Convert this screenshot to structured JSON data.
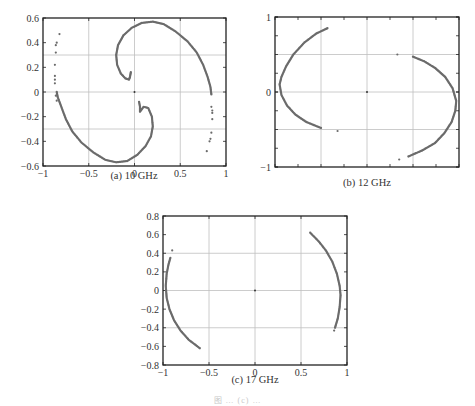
{
  "figure": {
    "caption": "图 … (c) …"
  },
  "chart_data": [
    {
      "id": "a",
      "type": "scatter",
      "title": "(a) 10 GHz",
      "xlabel": "",
      "ylabel": "",
      "xlim": [
        -1,
        1
      ],
      "ylim": [
        -0.6,
        0.6
      ],
      "xticks": [
        -1,
        -0.5,
        0,
        0.5,
        1
      ],
      "xtick_labels": [
        "−1",
        "−0.5",
        "0",
        "0.5",
        "1"
      ],
      "yticks": [
        -0.6,
        -0.4,
        -0.2,
        0,
        0.2,
        0.4,
        0.6
      ],
      "ytick_labels": [
        "−0.6",
        "−0.4",
        "−0.2",
        "0",
        "0.2",
        "0.4",
        "0.6"
      ],
      "minor_xticks": [],
      "minor_yticks": [],
      "grid_x": [
        -0.5,
        0,
        0.5
      ],
      "grid_y": [
        -0.3,
        0,
        0.3
      ],
      "center_point": [
        0,
        0
      ],
      "series": [
        {
          "name": "upper-spiral-arm",
          "points": [
            [
              -0.04,
              0.16
            ],
            [
              -0.05,
              0.12
            ],
            [
              -0.06,
              0.1
            ],
            [
              -0.1,
              0.11
            ],
            [
              -0.15,
              0.15
            ],
            [
              -0.19,
              0.22
            ],
            [
              -0.2,
              0.3
            ],
            [
              -0.18,
              0.38
            ],
            [
              -0.12,
              0.46
            ],
            [
              -0.03,
              0.52
            ],
            [
              0.08,
              0.56
            ],
            [
              0.2,
              0.57
            ],
            [
              0.32,
              0.55
            ],
            [
              0.45,
              0.49
            ],
            [
              0.58,
              0.41
            ],
            [
              0.68,
              0.32
            ],
            [
              0.75,
              0.22
            ],
            [
              0.8,
              0.12
            ],
            [
              0.83,
              0.04
            ],
            [
              0.84,
              -0.02
            ]
          ]
        },
        {
          "name": "lower-spiral-arm",
          "points": [
            [
              0.05,
              -0.08
            ],
            [
              0.06,
              -0.12
            ],
            [
              0.06,
              -0.16
            ],
            [
              0.1,
              -0.12
            ],
            [
              0.15,
              -0.13
            ],
            [
              0.19,
              -0.2
            ],
            [
              0.2,
              -0.28
            ],
            [
              0.18,
              -0.36
            ],
            [
              0.12,
              -0.44
            ],
            [
              0.03,
              -0.51
            ],
            [
              -0.08,
              -0.56
            ],
            [
              -0.2,
              -0.57
            ],
            [
              -0.32,
              -0.55
            ],
            [
              -0.45,
              -0.49
            ],
            [
              -0.58,
              -0.41
            ],
            [
              -0.68,
              -0.32
            ],
            [
              -0.75,
              -0.22
            ],
            [
              -0.8,
              -0.12
            ],
            [
              -0.84,
              -0.04
            ],
            [
              -0.85,
              0.0
            ]
          ]
        },
        {
          "name": "left-scatter",
          "points": [
            [
              -0.82,
              0.47
            ],
            [
              -0.85,
              0.4
            ],
            [
              -0.86,
              0.38
            ],
            [
              -0.86,
              0.32
            ],
            [
              -0.87,
              0.22
            ],
            [
              -0.87,
              0.13
            ],
            [
              -0.87,
              0.1
            ],
            [
              -0.87,
              0.07
            ],
            [
              -0.86,
              -0.03
            ],
            [
              -0.85,
              -0.07
            ]
          ]
        },
        {
          "name": "right-scatter",
          "points": [
            [
              0.84,
              -0.12
            ],
            [
              0.85,
              -0.15
            ],
            [
              0.85,
              -0.17
            ],
            [
              0.85,
              -0.22
            ],
            [
              0.84,
              -0.33
            ],
            [
              0.83,
              -0.38
            ],
            [
              0.82,
              -0.4
            ],
            [
              0.79,
              -0.48
            ]
          ]
        }
      ]
    },
    {
      "id": "b",
      "type": "scatter",
      "title": "(b) 12 GHz",
      "xlabel": "",
      "ylabel": "",
      "xlim": [
        -1,
        1
      ],
      "ylim": [
        -1,
        1
      ],
      "xticks": [],
      "xtick_labels": [],
      "yticks": [
        -1,
        0,
        1
      ],
      "ytick_labels": [
        "−1",
        "0",
        "1"
      ],
      "minor_xticks": [
        -1,
        -0.75,
        -0.5,
        -0.25,
        0,
        0.25,
        0.5,
        0.75,
        1
      ],
      "minor_yticks": [
        -1,
        -0.75,
        -0.5,
        -0.25,
        0,
        0.25,
        0.5,
        0.75,
        1
      ],
      "grid_x": [
        -0.5,
        0,
        0.5
      ],
      "grid_y": [
        -0.5,
        0,
        0.5
      ],
      "center_point": [
        0,
        0
      ],
      "series": [
        {
          "name": "left-arc",
          "points": [
            [
              -0.43,
              0.85
            ],
            [
              -0.55,
              0.78
            ],
            [
              -0.68,
              0.66
            ],
            [
              -0.8,
              0.5
            ],
            [
              -0.88,
              0.34
            ],
            [
              -0.93,
              0.2
            ],
            [
              -0.95,
              0.1
            ],
            [
              -0.93,
              -0.04
            ],
            [
              -0.87,
              -0.18
            ],
            [
              -0.78,
              -0.3
            ],
            [
              -0.66,
              -0.4
            ],
            [
              -0.5,
              -0.48
            ]
          ]
        },
        {
          "name": "right-arc",
          "points": [
            [
              0.5,
              0.47
            ],
            [
              0.62,
              0.41
            ],
            [
              0.74,
              0.32
            ],
            [
              0.85,
              0.2
            ],
            [
              0.93,
              0.05
            ],
            [
              0.97,
              -0.12
            ],
            [
              0.96,
              -0.25
            ],
            [
              0.92,
              -0.4
            ],
            [
              0.84,
              -0.55
            ],
            [
              0.74,
              -0.68
            ],
            [
              0.6,
              -0.78
            ],
            [
              0.45,
              -0.86
            ]
          ]
        },
        {
          "name": "isolated-points",
          "points": [
            [
              0.33,
              0.5
            ],
            [
              -0.32,
              -0.52
            ],
            [
              0.35,
              -0.9
            ]
          ]
        }
      ]
    },
    {
      "id": "c",
      "type": "scatter",
      "title": "(c) 17 GHz",
      "xlabel": "",
      "ylabel": "",
      "xlim": [
        -1,
        1
      ],
      "ylim": [
        -0.8,
        0.8
      ],
      "xticks": [
        -1,
        -0.5,
        0,
        0.5,
        1
      ],
      "xtick_labels": [
        "−1",
        "−0.5",
        "0",
        "0.5",
        "1"
      ],
      "yticks": [
        -0.8,
        -0.6,
        -0.4,
        -0.2,
        0,
        0.2,
        0.4,
        0.6,
        0.8
      ],
      "ytick_labels": [
        "−0.8",
        "−0.6",
        "−0.4",
        "−0.2",
        "0",
        "0.2",
        "0.4",
        "0.6",
        "0.8"
      ],
      "minor_xticks": [],
      "minor_yticks": [],
      "grid_x": [
        -0.5,
        0,
        0.5
      ],
      "grid_y": [
        -0.4,
        0,
        0.4
      ],
      "center_point": [
        0,
        0
      ],
      "series": [
        {
          "name": "left-arc",
          "points": [
            [
              -0.92,
              0.35
            ],
            [
              -0.94,
              0.28
            ],
            [
              -0.96,
              0.18
            ],
            [
              -0.97,
              0.05
            ],
            [
              -0.96,
              -0.08
            ],
            [
              -0.93,
              -0.2
            ],
            [
              -0.88,
              -0.32
            ],
            [
              -0.81,
              -0.43
            ],
            [
              -0.72,
              -0.53
            ],
            [
              -0.6,
              -0.62
            ]
          ]
        },
        {
          "name": "right-arc",
          "points": [
            [
              0.6,
              0.62
            ],
            [
              0.69,
              0.53
            ],
            [
              0.77,
              0.43
            ],
            [
              0.84,
              0.31
            ],
            [
              0.89,
              0.18
            ],
            [
              0.92,
              0.05
            ],
            [
              0.93,
              -0.05
            ],
            [
              0.92,
              -0.18
            ],
            [
              0.9,
              -0.3
            ],
            [
              0.87,
              -0.4
            ]
          ]
        },
        {
          "name": "isolated-points",
          "points": [
            [
              -0.9,
              0.43
            ],
            [
              0.86,
              -0.43
            ]
          ]
        }
      ]
    }
  ],
  "layout": {
    "panels": [
      {
        "id": "a",
        "left": 43,
        "top": 18,
        "width": 183,
        "height": 148,
        "caption_x": 134,
        "caption_y": 174
      },
      {
        "id": "b",
        "left": 275,
        "top": 17,
        "width": 184,
        "height": 150,
        "caption_x": 367,
        "caption_y": 181
      },
      {
        "id": "c",
        "left": 163,
        "top": 216,
        "width": 184,
        "height": 149,
        "caption_x": 255,
        "caption_y": 378
      }
    ],
    "point_color": "#6b6b6b",
    "axis_color": "#222222",
    "grid_color": "#bfbfbf"
  }
}
